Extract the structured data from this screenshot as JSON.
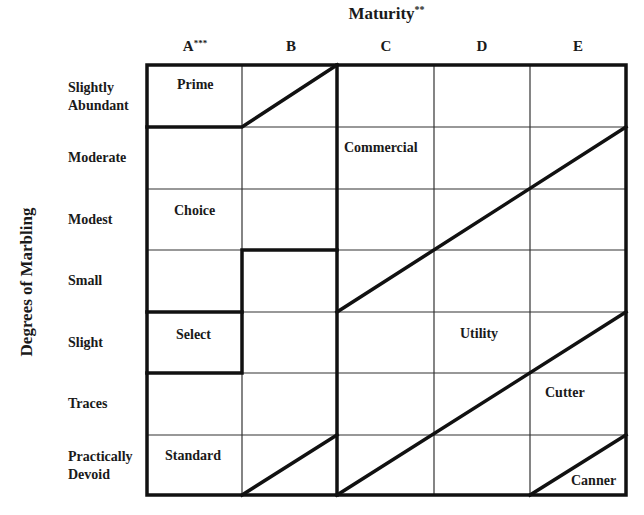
{
  "title": {
    "text": "Maturity",
    "suffix": "**"
  },
  "y_axis_label": "Degrees of Marbling",
  "columns": [
    {
      "label": "A",
      "suffix": "***"
    },
    {
      "label": "B",
      "suffix": ""
    },
    {
      "label": "C",
      "suffix": ""
    },
    {
      "label": "D",
      "suffix": ""
    },
    {
      "label": "E",
      "suffix": ""
    }
  ],
  "rows": [
    {
      "line1": "Slightly",
      "line2": "Abundant"
    },
    {
      "line1": "Moderate",
      "line2": ""
    },
    {
      "line1": "Modest",
      "line2": ""
    },
    {
      "line1": "Small",
      "line2": ""
    },
    {
      "line1": "Slight",
      "line2": ""
    },
    {
      "line1": "Traces",
      "line2": ""
    },
    {
      "line1": "Practically",
      "line2": "Devoid"
    }
  ],
  "grades": {
    "prime": "Prime",
    "choice": "Choice",
    "select": "Select",
    "standard": "Standard",
    "commercial": "Commercial",
    "utility": "Utility",
    "cutter": "Cutter",
    "canner": "Canner"
  },
  "colors": {
    "line": "#111111",
    "grid": "#333333",
    "background": "#ffffff"
  }
}
